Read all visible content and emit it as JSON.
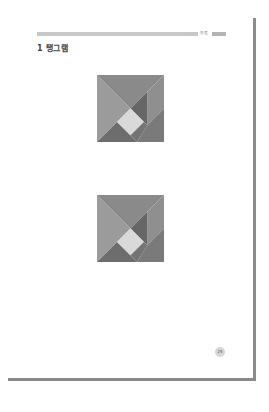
{
  "header": {
    "section_label": "부록",
    "bar_color": "#c8c8c8",
    "tab_color": "#b4b4b4"
  },
  "title": {
    "number": "1",
    "text": "탱그램",
    "full": "1 탱그램"
  },
  "figures": [
    {
      "name": "tangram-square-1",
      "pieces": [
        {
          "name": "large-triangle-top",
          "color": "#8a8a8a"
        },
        {
          "name": "large-triangle-left",
          "color": "#9b9b9b"
        },
        {
          "name": "parallelogram-right",
          "color": "#8f8f8f"
        },
        {
          "name": "medium-triangle-center-right",
          "color": "#666666"
        },
        {
          "name": "small-square-center",
          "color": "#d9d9d9"
        },
        {
          "name": "small-triangle-bottom-left",
          "color": "#6d6d6d"
        },
        {
          "name": "triangle-bottom-right",
          "color": "#7a7a7a"
        }
      ]
    },
    {
      "name": "tangram-square-2",
      "pieces": [
        {
          "name": "large-triangle-top",
          "color": "#8a8a8a"
        },
        {
          "name": "large-triangle-left",
          "color": "#9b9b9b"
        },
        {
          "name": "parallelogram-right",
          "color": "#8f8f8f"
        },
        {
          "name": "medium-triangle-center-right",
          "color": "#666666"
        },
        {
          "name": "small-square-center",
          "color": "#d9d9d9"
        },
        {
          "name": "small-triangle-bottom-left",
          "color": "#6d6d6d"
        },
        {
          "name": "triangle-bottom-right",
          "color": "#7a7a7a"
        }
      ]
    }
  ],
  "footer": {
    "page_number": "25"
  },
  "colors": {
    "page_edge": "#8c8c8c",
    "title_text": "#444444"
  }
}
